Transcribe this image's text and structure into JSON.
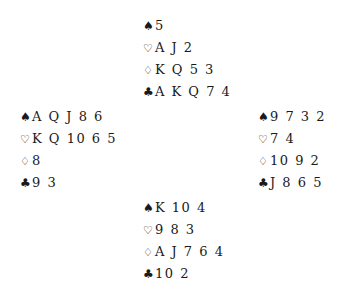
{
  "diagram_type": "bridge-deal",
  "suits": {
    "spades": "♠",
    "hearts": "♡",
    "diamonds": "♢",
    "clubs": "♣"
  },
  "hands": {
    "north": {
      "spades": "5",
      "hearts": "A J 2",
      "diamonds": "K Q 5 3",
      "clubs": "A K Q 7 4"
    },
    "west": {
      "spades": "A Q J 8 6",
      "hearts": "K Q 10 6 5",
      "diamonds": "8",
      "clubs": "9 3"
    },
    "east": {
      "spades": "9 7 3 2",
      "hearts": "7 4",
      "diamonds": "10 9 2",
      "clubs": "J 8 6 5"
    },
    "south": {
      "spades": "K 10 4",
      "hearts": "9 8 3",
      "diamonds": "A J 7 6 4",
      "clubs": "10 2"
    }
  }
}
